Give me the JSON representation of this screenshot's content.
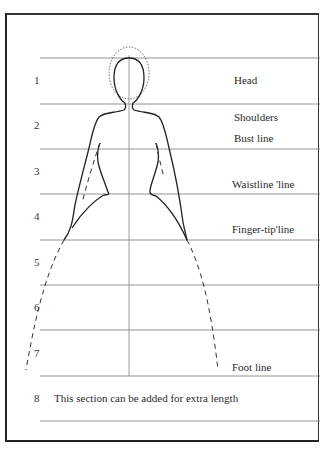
{
  "diagram": {
    "type": "fashion-figure-proportion-chart",
    "section_numbers": [
      "1",
      "2",
      "3",
      "4",
      "5",
      "6",
      "7",
      "8"
    ],
    "labels": {
      "head": "Head",
      "shoulders": "Shoulders",
      "bust": "Bust line",
      "waist": "Waistline 'line",
      "fingertip": "Finger-tip'line",
      "foot": "Foot line"
    },
    "extra_note": "This section can be added for extra length",
    "colors": {
      "line": "#333333",
      "guide": "#888888",
      "background": "#ffffff"
    }
  }
}
